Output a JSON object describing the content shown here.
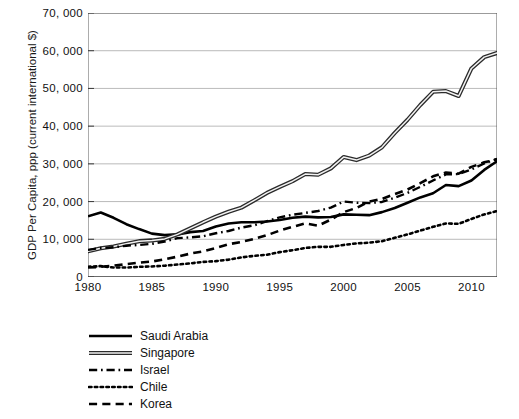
{
  "chart_data": {
    "type": "line",
    "title": "",
    "xlabel": "",
    "ylabel": "GDP Per Capita, ppp (current international $)",
    "xlim": [
      1980,
      2012
    ],
    "ylim": [
      0,
      70000
    ],
    "grid": true,
    "grid_axis": "y",
    "legend_position": "below-left",
    "x_ticks": [
      1980,
      1985,
      1990,
      1995,
      2000,
      2005,
      2010
    ],
    "x_tick_labels": [
      "1980",
      "1985",
      "1990",
      "1995",
      "2000",
      "2005",
      "2010"
    ],
    "y_ticks": [
      0,
      10000,
      20000,
      30000,
      40000,
      50000,
      60000,
      70000
    ],
    "y_tick_labels": [
      "0",
      "10, 000",
      "20, 000",
      "30, 000",
      "40, 000",
      "50, 000",
      "60, 000",
      "70, 000"
    ],
    "x": [
      1980,
      1981,
      1982,
      1983,
      1984,
      1985,
      1986,
      1987,
      1988,
      1989,
      1990,
      1991,
      1992,
      1993,
      1994,
      1995,
      1996,
      1997,
      1998,
      1999,
      2000,
      2001,
      2002,
      2003,
      2004,
      2005,
      2006,
      2007,
      2008,
      2009,
      2010,
      2011,
      2012
    ],
    "series": [
      {
        "name": "Saudi Arabia",
        "style": "solid",
        "color": "#000000",
        "width": 2.6,
        "values": [
          16100,
          17100,
          15700,
          14000,
          12700,
          11500,
          11100,
          11300,
          11900,
          12200,
          13400,
          14200,
          14500,
          14500,
          14700,
          15100,
          15700,
          16000,
          15800,
          15900,
          16600,
          16500,
          16400,
          17200,
          18300,
          19700,
          21100,
          22200,
          24400,
          24100,
          25600,
          28400,
          30700
        ]
      },
      {
        "name": "Singapore",
        "style": "double",
        "color": "#4d4d4d",
        "width": 2.4,
        "values": [
          6800,
          7600,
          8100,
          8800,
          9500,
          9700,
          10100,
          11300,
          12900,
          14500,
          16000,
          17300,
          18400,
          20300,
          22300,
          23900,
          25400,
          27300,
          27100,
          28800,
          31800,
          31000,
          32200,
          34400,
          38200,
          41700,
          45600,
          49100,
          49300,
          48000,
          55300,
          58300,
          59400
        ]
      },
      {
        "name": "Israel",
        "style": "dashdot",
        "color": "#000000",
        "width": 2.4,
        "values": [
          7200,
          7700,
          7900,
          8300,
          8500,
          8800,
          9400,
          10300,
          10500,
          10800,
          11600,
          12200,
          13100,
          13700,
          14800,
          15800,
          16500,
          17000,
          17500,
          18400,
          20000,
          19700,
          19600,
          19900,
          21000,
          22300,
          23900,
          25600,
          27200,
          27300,
          28500,
          30100,
          31300
        ]
      },
      {
        "name": "Chile",
        "style": "dotted",
        "color": "#000000",
        "width": 2.6,
        "values": [
          2700,
          2900,
          2500,
          2500,
          2700,
          2800,
          3000,
          3300,
          3600,
          4000,
          4200,
          4600,
          5200,
          5600,
          5900,
          6600,
          7100,
          7700,
          8000,
          8000,
          8500,
          8900,
          9100,
          9500,
          10400,
          11300,
          12300,
          13300,
          14200,
          14100,
          15400,
          16600,
          17500
        ]
      },
      {
        "name": "Korea",
        "style": "dashed",
        "color": "#000000",
        "width": 2.6,
        "values": [
          2500,
          2700,
          3000,
          3400,
          3800,
          4100,
          4700,
          5400,
          6200,
          6800,
          7700,
          8700,
          9300,
          10100,
          11100,
          12300,
          13300,
          14200,
          13600,
          15200,
          17200,
          18300,
          20000,
          20700,
          22000,
          23200,
          24900,
          26700,
          27700,
          27400,
          29200,
          30400,
          31200
        ]
      }
    ]
  },
  "legend": {
    "items": [
      {
        "label": "Saudi Arabia",
        "swatch": "solid-line-swatch"
      },
      {
        "label": "Singapore",
        "swatch": "double-line-swatch"
      },
      {
        "label": "Israel",
        "swatch": "dash-dot-line-swatch"
      },
      {
        "label": "Chile",
        "swatch": "dotted-line-swatch"
      },
      {
        "label": "Korea",
        "swatch": "dashed-line-swatch"
      }
    ]
  }
}
